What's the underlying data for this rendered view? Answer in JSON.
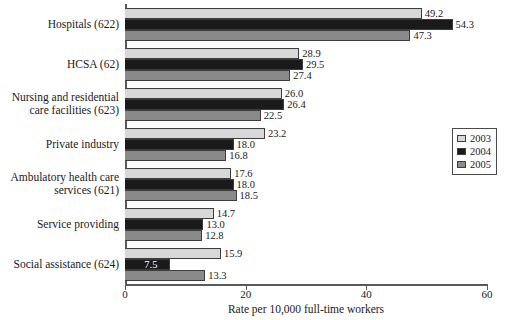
{
  "chart_data": {
    "type": "bar",
    "orientation": "horizontal",
    "title": "",
    "xlabel": "Rate per 10,000 full-time workers",
    "ylabel": "",
    "xlim": [
      0,
      60
    ],
    "xticks": [
      0,
      20,
      40,
      60
    ],
    "xtick_labels": [
      "0",
      "20",
      "40",
      "60"
    ],
    "grid": false,
    "legend_position": "right",
    "categories": [
      "Hospitals (622)",
      "HCSA (62)",
      "Nursing and residential\ncare facilities (623)",
      "Private industry",
      "Ambulatory health care\nservices (621)",
      "Service providing",
      "Social assistance (624)"
    ],
    "series": [
      {
        "name": "2003",
        "color": "#d8d8d8",
        "values": [
          49.2,
          28.9,
          26.0,
          23.2,
          17.6,
          14.7,
          15.9
        ],
        "value_labels": [
          "49.2",
          "28.9",
          "26.0",
          "23.2",
          "17.6",
          "14.7",
          "15.9"
        ]
      },
      {
        "name": "2004",
        "color": "#1a1a1a",
        "values": [
          54.3,
          29.5,
          26.4,
          18.0,
          18.0,
          13.0,
          7.5
        ],
        "value_labels": [
          "54.3",
          "29.5",
          "26.4",
          "18.0",
          "18.0",
          "13.0",
          "7.5"
        ]
      },
      {
        "name": "2005",
        "color": "#8a8a8a",
        "values": [
          47.3,
          27.4,
          22.5,
          16.8,
          18.5,
          12.8,
          13.3
        ],
        "value_labels": [
          "47.3",
          "27.4",
          "22.5",
          "16.8",
          "18.5",
          "12.8",
          "13.3"
        ]
      }
    ]
  },
  "legend": {
    "items": [
      {
        "label": "2003",
        "color": "#d8d8d8"
      },
      {
        "label": "2004",
        "color": "#1a1a1a"
      },
      {
        "label": "2005",
        "color": "#8a8a8a"
      }
    ]
  }
}
